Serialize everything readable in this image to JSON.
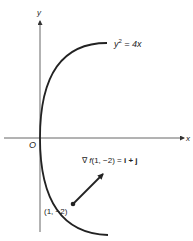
{
  "figure": {
    "axes": {
      "x_label": "x",
      "y_label": "y",
      "origin_label": "O"
    },
    "curve": {
      "equation_var": "y",
      "equation_exp": "2",
      "equation_rhs": " = 4x",
      "description": "parabola y^2 = 4x opening right"
    },
    "point": {
      "label": "(1, −2)"
    },
    "gradient": {
      "label_prefix": "∇ ",
      "label_f": "f",
      "label_args": "(1, −2) = ",
      "label_rhs": "i + j"
    },
    "colors": {
      "ink": "#222222",
      "axis": "#555555",
      "background": "#ffffff"
    }
  }
}
